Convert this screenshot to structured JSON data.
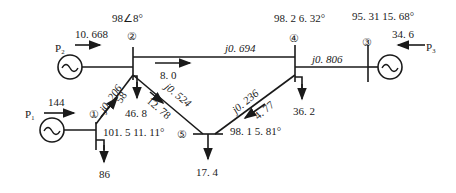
{
  "buses": [
    {
      "id": "1",
      "label": "①",
      "voltage": "101. 5 11. 11°"
    },
    {
      "id": "2",
      "label": "②",
      "voltage": "98∠8°"
    },
    {
      "id": "3",
      "label": "③",
      "voltage": "95. 31 15. 68°"
    },
    {
      "id": "4",
      "label": "④",
      "voltage": "98. 2  6. 32°"
    },
    {
      "id": "5",
      "label": "⑤",
      "voltage": "98. 1 5. 81°"
    }
  ],
  "generators": [
    {
      "bus": "1",
      "name": "P₁",
      "power": "144"
    },
    {
      "bus": "2",
      "name": "P₂",
      "power": "10. 668"
    },
    {
      "bus": "3",
      "name": "P₃",
      "power": "34. 6"
    }
  ],
  "loads": [
    {
      "bus": "1",
      "value": "86"
    },
    {
      "bus": "2",
      "value": "46. 8"
    },
    {
      "bus": "4",
      "value": "36. 2"
    },
    {
      "bus": "5",
      "value": "17. 4"
    }
  ],
  "lines": [
    {
      "from": "2",
      "to": "4",
      "impedance": "j0. 694",
      "flow": "8. 0"
    },
    {
      "from": "4",
      "to": "3",
      "impedance": "j0. 806"
    },
    {
      "from": "1",
      "to": "2",
      "impedance": "j0. 206",
      "flow": "58"
    },
    {
      "from": "2",
      "to": "5",
      "impedance": "j0. 524",
      "flow": "12. 78"
    },
    {
      "from": "4",
      "to": "5",
      "impedance": "j0. 236",
      "flow": "4. 77"
    }
  ]
}
